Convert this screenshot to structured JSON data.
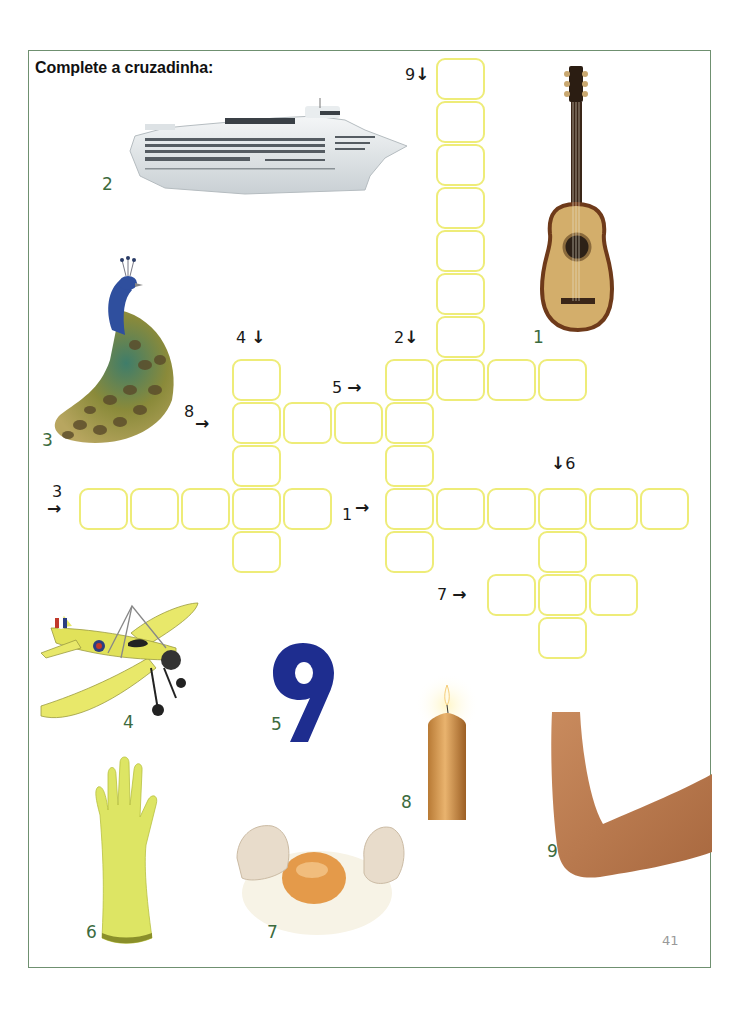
{
  "page": {
    "title": "Complete a cruzadinha:",
    "page_number": "41",
    "border_color": "#6f9070",
    "cell_border_color": "#eeec78",
    "label_color": "#3c6b3e"
  },
  "clues": [
    {
      "id": "9",
      "text": "9",
      "direction": "down",
      "arrow": "↓"
    },
    {
      "id": "4",
      "text": "4",
      "direction": "down",
      "arrow": "↓"
    },
    {
      "id": "2",
      "text": "2",
      "direction": "down",
      "arrow": "↓"
    },
    {
      "id": "5",
      "text": "5",
      "direction": "across",
      "arrow": "→"
    },
    {
      "id": "8",
      "text": "8",
      "direction": "across",
      "arrow": "→"
    },
    {
      "id": "3",
      "text": "3",
      "direction": "across",
      "arrow": "→"
    },
    {
      "id": "1",
      "text": "1",
      "direction": "across",
      "arrow": "→"
    },
    {
      "id": "6",
      "text": "6",
      "direction": "down",
      "arrow": "↓"
    },
    {
      "id": "7",
      "text": "7",
      "direction": "across",
      "arrow": "→"
    }
  ],
  "pictures": [
    {
      "number": "1",
      "subject": "guitar-icon"
    },
    {
      "number": "2",
      "subject": "ship-icon"
    },
    {
      "number": "3",
      "subject": "peacock-icon"
    },
    {
      "number": "4",
      "subject": "airplane-icon"
    },
    {
      "number": "5",
      "subject": "number-nine-icon"
    },
    {
      "number": "6",
      "subject": "glove-icon"
    },
    {
      "number": "7",
      "subject": "egg-icon"
    },
    {
      "number": "8",
      "subject": "candle-icon"
    },
    {
      "number": "9",
      "subject": "arm-elbow-icon"
    }
  ],
  "grid": {
    "words": [
      {
        "clue": "9",
        "direction": "down",
        "start_col": 7,
        "start_row": 0,
        "length": 8
      },
      {
        "clue": "5",
        "direction": "across",
        "start_col": 6,
        "start_row": 7,
        "length": 4
      },
      {
        "clue": "2",
        "direction": "down",
        "start_col": 6,
        "start_row": 7,
        "length": 5
      },
      {
        "clue": "8",
        "direction": "across",
        "start_col": 3,
        "start_row": 8,
        "length": 4
      },
      {
        "clue": "4",
        "direction": "down",
        "start_col": 3,
        "start_row": 7,
        "length": 5
      },
      {
        "clue": "3",
        "direction": "across",
        "start_col": 0,
        "start_row": 10,
        "length": 5
      },
      {
        "clue": "1",
        "direction": "across",
        "start_col": 6,
        "start_row": 10,
        "length": 6
      },
      {
        "clue": "6",
        "direction": "down",
        "start_col": 9,
        "start_row": 10,
        "length": 4
      },
      {
        "clue": "7",
        "direction": "across",
        "start_col": 8,
        "start_row": 12,
        "length": 3
      }
    ]
  }
}
